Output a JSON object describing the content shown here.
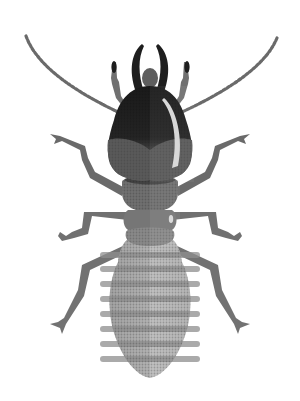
{
  "image": {
    "subject": "Termite illustration",
    "description": "Stylized grayscale halftone illustration of a termite viewed from above: dark head with curved mandibles and segmented antennae, mid-gray thorax with six jointed legs, and a pale banded abdomen.",
    "background": "#ffffff"
  },
  "parts": {
    "head": "head",
    "mandibles": "mandibles",
    "antennae": "antennae",
    "palps": "palps",
    "thorax": "thorax",
    "legs": "legs",
    "abdomen": "abdomen"
  },
  "palette": {
    "head_dark": "#1e1e1e",
    "head_mid": "#5a5a5a",
    "thorax": "#6e6e6e",
    "legs": "#707070",
    "abdomen_light": "#b8b8b8",
    "abdomen_band": "#8e8e8e",
    "highlight": "#d8d8d8"
  }
}
